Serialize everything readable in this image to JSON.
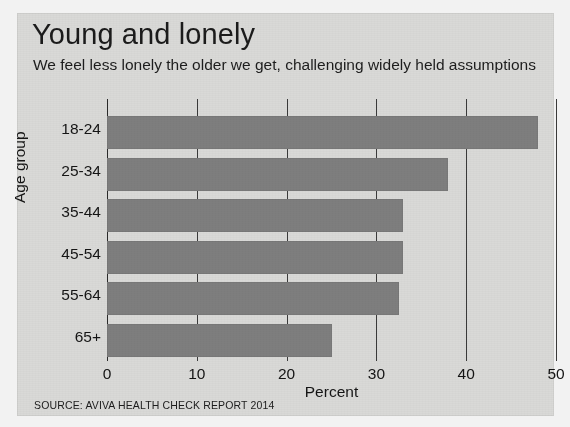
{
  "chart_data": {
    "type": "bar",
    "orientation": "horizontal",
    "title": "Young and lonely",
    "subtitle": "We feel less lonely the older we get, challenging widely held assumptions",
    "xlabel": "Percent",
    "ylabel": "Age group",
    "categories": [
      "18-24",
      "25-34",
      "35-44",
      "45-54",
      "55-64",
      "65+"
    ],
    "values": [
      48,
      38,
      33,
      33,
      32.5,
      25
    ],
    "xlim": [
      0,
      50
    ],
    "xticks": [
      0,
      10,
      20,
      30,
      40,
      50
    ],
    "xtick_labels": [
      "0",
      "10",
      "20",
      "30",
      "40",
      "50"
    ],
    "grid": true,
    "legend": null,
    "bar_color": "#7e7e7e",
    "background_color": "#d9d9d7",
    "source": "SOURCE: AVIVA HEALTH CHECK REPORT 2014"
  }
}
